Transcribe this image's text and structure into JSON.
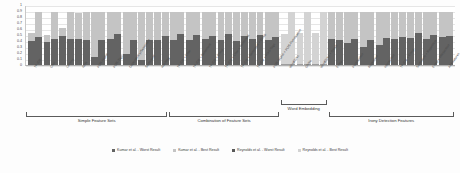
{
  "chart_data": {
    "type": "bar",
    "title": "",
    "subtitle": "",
    "xlabel": "",
    "ylabel": "",
    "ylim": [
      0,
      1
    ],
    "grid": true,
    "stacked": true,
    "legend_position": "bottom",
    "yticks": [
      "1",
      "0.9",
      "0.8",
      "0.7",
      "0.6",
      "0.5",
      "0.4",
      "0.3",
      "0.2",
      "0.1",
      "0"
    ],
    "categories": [
      "TF-IDF",
      "Char",
      "Lemma",
      "NER",
      "POS-NOAA",
      "POS-Tags",
      "Dependency/Sentiment",
      "Sentiment",
      "Hashtag",
      "TF-IDF + Char",
      "TF-IDF + Sentiment",
      "TF-IDF + Emoji",
      "TF-IDF + Char + Sentiment",
      "TF-IDF + Sentiment + Emoji",
      "TF-IDF + POS-Tags",
      "POS-NOAA + POS-Punctuation",
      "Word2Vec",
      "GloVe",
      "Word2Vec + GloVe",
      "Emoji",
      "Punctuation",
      "Repetition",
      "Interjection",
      "TF-IDF + Emoji",
      "Sentiment + Repetition",
      "Emoji + Interjection",
      "All Features"
    ],
    "series": [
      {
        "name": "Kumar et al. - Worst Result",
        "color": "#636363",
        "values": [
          0.4,
          0.47,
          0.38,
          0.44,
          0.48,
          0.43,
          0.13,
          0.43,
          0.5,
          0.36,
          0.17,
          0.22,
          0.09,
          0.41,
          0.48,
          0.42,
          0.5,
          0.49,
          0.47,
          0.51,
          0.4,
          0.43,
          0.45,
          0.41,
          0.38,
          0.36,
          0.44
        ]
      },
      {
        "name": "Kumar et al. - Best Result",
        "color": "#c4c4c4",
        "values": [
          0.13,
          0.41,
          0.13,
          0.41,
          0.12,
          0.45,
          0.77,
          0.45,
          0.12,
          0.52,
          0.72,
          0.66,
          0.79,
          0.47,
          0.4,
          0.46,
          0.38,
          0.39,
          0.41,
          0.37,
          0.48,
          0.45,
          0.43,
          0.47,
          0.5,
          0.52,
          0.44
        ]
      },
      {
        "name": "Reynolds et al. - Worst Result",
        "color": "#585858",
        "values": [
          0.4,
          0.47,
          0.38,
          0.44,
          0.48,
          0.43,
          0.13,
          0.43,
          0.5,
          0.36,
          0.17,
          0.22,
          0.09,
          0.41,
          0.48,
          0.42,
          0.5,
          0.49,
          0.47,
          0.51,
          0.4,
          0.43,
          0.45,
          0.41,
          0.38,
          0.36,
          0.44
        ]
      },
      {
        "name": "Reynolds et al. - Best Result",
        "color": "#d3d3d3",
        "values": [
          0.13,
          0.41,
          0.13,
          0.41,
          0.12,
          0.45,
          0.77,
          0.45,
          0.12,
          0.52,
          0.72,
          0.66,
          0.79,
          0.47,
          0.4,
          0.46,
          0.38,
          0.39,
          0.41,
          0.37,
          0.48,
          0.45,
          0.43,
          0.47,
          0.5,
          0.52,
          0.44
        ]
      }
    ],
    "bars": [
      {
        "category": "TF-IDF",
        "left_bottom": 0.4,
        "left_top": 0.13,
        "right_bottom": 0.47,
        "right_top": 0.41,
        "style": "kumar"
      },
      {
        "category": "Char",
        "left_bottom": 0.38,
        "left_top": 0.12,
        "right_bottom": 0.44,
        "right_top": 0.45,
        "style": "kumar"
      },
      {
        "category": "Lemma",
        "left_bottom": 0.48,
        "left_top": 0.13,
        "right_bottom": 0.43,
        "right_top": 0.46,
        "style": "kumar"
      },
      {
        "category": "NER",
        "left_bottom": 0.44,
        "left_top": 0.43,
        "right_bottom": 0.41,
        "right_top": 0.47,
        "style": "kumar"
      },
      {
        "category": "POS-NOAA",
        "left_bottom": 0.13,
        "left_top": 0.76,
        "right_bottom": 0.42,
        "right_top": 0.47,
        "style": "kumar"
      },
      {
        "category": "POS-Tags",
        "left_bottom": 0.43,
        "left_top": 0.45,
        "right_bottom": 0.51,
        "right_top": 0.38,
        "style": "kumar"
      },
      {
        "category": "Dependency/Sentiment",
        "left_bottom": 0.18,
        "left_top": 0.71,
        "right_bottom": 0.42,
        "right_top": 0.46,
        "style": "kumar"
      },
      {
        "category": "Sentiment",
        "left_bottom": 0.09,
        "left_top": 0.8,
        "right_bottom": 0.42,
        "right_top": 0.46,
        "style": "kumar"
      },
      {
        "category": "Hashtag",
        "left_bottom": 0.41,
        "left_top": 0.47,
        "right_bottom": 0.49,
        "right_top": 0.4,
        "style": "kumar"
      },
      {
        "category": "TF-IDF + Char",
        "left_bottom": 0.42,
        "left_top": 0.46,
        "right_bottom": 0.51,
        "right_top": 0.38,
        "style": "kumar"
      },
      {
        "category": "TF-IDF + Sentiment",
        "left_bottom": 0.41,
        "left_top": 0.47,
        "right_bottom": 0.5,
        "right_top": 0.39,
        "style": "kumar"
      },
      {
        "category": "TF-IDF + Emoji",
        "left_bottom": 0.43,
        "left_top": 0.45,
        "right_bottom": 0.49,
        "right_top": 0.4,
        "style": "kumar"
      },
      {
        "category": "TF-IDF + Char + Sentiment",
        "left_bottom": 0.42,
        "left_top": 0.46,
        "right_bottom": 0.51,
        "right_top": 0.38,
        "style": "kumar"
      },
      {
        "category": "TF-IDF + Sentiment + Emoji",
        "left_bottom": 0.4,
        "left_top": 0.48,
        "right_bottom": 0.48,
        "right_top": 0.41,
        "style": "kumar"
      },
      {
        "category": "TF-IDF + POS-Tags",
        "left_bottom": 0.43,
        "left_top": 0.45,
        "right_bottom": 0.5,
        "right_top": 0.39,
        "style": "kumar"
      },
      {
        "category": "POS-NOAA + POS-Punctuation",
        "left_bottom": 0.41,
        "left_top": 0.47,
        "right_bottom": 0.47,
        "right_top": 0.42,
        "style": "kumar"
      },
      {
        "category": "Word2Vec",
        "left_bottom": 0.02,
        "left_top": 0.5,
        "right_bottom": 0.02,
        "right_top": 0.86,
        "style": "reynolds"
      },
      {
        "category": "GloVe",
        "left_bottom": 0.02,
        "left_top": 0.52,
        "right_bottom": 0.02,
        "right_top": 0.87,
        "style": "reynolds"
      },
      {
        "category": "Word2Vec + GloVe",
        "left_bottom": 0.02,
        "left_top": 0.51,
        "right_bottom": 0.02,
        "right_top": 0.86,
        "style": "reynolds"
      },
      {
        "category": "Emoji",
        "left_bottom": 0.44,
        "left_top": 0.44,
        "right_bottom": 0.42,
        "right_top": 0.46,
        "style": "kumar"
      },
      {
        "category": "Punctuation",
        "left_bottom": 0.37,
        "left_top": 0.51,
        "right_bottom": 0.44,
        "right_top": 0.44,
        "style": "kumar"
      },
      {
        "category": "Repetition",
        "left_bottom": 0.3,
        "left_top": 0.58,
        "right_bottom": 0.41,
        "right_top": 0.47,
        "style": "kumar"
      },
      {
        "category": "Interjection",
        "left_bottom": 0.33,
        "left_top": 0.55,
        "right_bottom": 0.45,
        "right_top": 0.43,
        "style": "kumar"
      },
      {
        "category": "TF-IDF + Emoji",
        "left_bottom": 0.44,
        "left_top": 0.44,
        "right_bottom": 0.46,
        "right_top": 0.42,
        "style": "kumar"
      },
      {
        "category": "Sentiment + Repetition",
        "left_bottom": 0.45,
        "left_top": 0.43,
        "right_bottom": 0.54,
        "right_top": 0.35,
        "style": "kumar"
      },
      {
        "category": "Emoji + Interjection",
        "left_bottom": 0.43,
        "left_top": 0.45,
        "right_bottom": 0.5,
        "right_top": 0.39,
        "style": "kumar"
      },
      {
        "category": "All Features",
        "left_bottom": 0.47,
        "left_top": 0.41,
        "right_bottom": 0.49,
        "right_top": 0.4,
        "style": "kumar"
      }
    ],
    "groups": [
      {
        "label": "Simple Feature Sets",
        "start": 0,
        "end": 8
      },
      {
        "label": "Combination of Feature Sets",
        "start": 9,
        "end": 15
      },
      {
        "label": "Word Embedding",
        "start": 16,
        "end": 18
      },
      {
        "label": "Irony Detection Features",
        "start": 19,
        "end": 26
      }
    ],
    "legend": [
      {
        "label": "Kumar et al. - Worst Result",
        "color": "#636363"
      },
      {
        "label": "Kumar et al. - Best Result",
        "color": "#c4c4c4"
      },
      {
        "label": "Reynolds et al. - Worst Result",
        "color": "#585858"
      },
      {
        "label": "Reynolds et al. - Best Result",
        "color": "#d3d3d3"
      }
    ]
  }
}
